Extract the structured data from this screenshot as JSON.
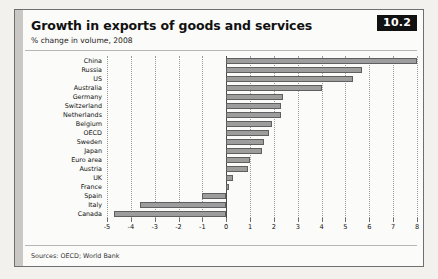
{
  "badge": "10.2",
  "header": {
    "title": "Growth in exports of goods and services",
    "subtitle": "% change in volume, 2008"
  },
  "footer": {
    "sources": "Sources: OECD; World Bank"
  },
  "chart_data": {
    "type": "bar",
    "orientation": "horizontal",
    "title": "Growth in exports of goods and services",
    "subtitle": "% change in volume, 2008",
    "xlabel": "",
    "ylabel": "",
    "xlim": [
      -5,
      8
    ],
    "xticks": [
      -5,
      -4,
      -3,
      -2,
      -1,
      0,
      1,
      2,
      3,
      4,
      5,
      6,
      7,
      8
    ],
    "xtick_labels": [
      "-5",
      "-4",
      "-3",
      "-2",
      "-1",
      "0",
      "1",
      "2",
      "3",
      "4",
      "5",
      "6",
      "7",
      "8"
    ],
    "grid": true,
    "legend": false,
    "bar_color": "#9d9d9d",
    "bar_edge_color": "#5f5f5f",
    "categories": [
      "China",
      "Russia",
      "US",
      "Australia",
      "Germany",
      "Switzerland",
      "Netherlands",
      "Belgium",
      "OECD",
      "Sweden",
      "Japan",
      "Euro area",
      "Austria",
      "UK",
      "France",
      "Spain",
      "Italy",
      "Canada"
    ],
    "values": [
      8.0,
      5.7,
      5.3,
      4.0,
      2.4,
      2.3,
      2.3,
      1.9,
      1.8,
      1.6,
      1.5,
      1.0,
      0.9,
      0.3,
      0.1,
      -1.0,
      -3.6,
      -4.7
    ]
  }
}
